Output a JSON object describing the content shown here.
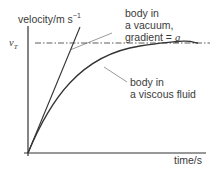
{
  "diagram": {
    "y_axis_label": "velocity/m s",
    "y_axis_label_sup": "−1",
    "x_axis_label": "time/s",
    "terminal_velocity_label": "v",
    "terminal_velocity_sub": "T",
    "vacuum_label": [
      "body in",
      "a vacuum,",
      "gradient = "
    ],
    "vacuum_gradient_symbol": "g",
    "fluid_label": [
      "body in",
      "a viscous fluid"
    ]
  }
}
